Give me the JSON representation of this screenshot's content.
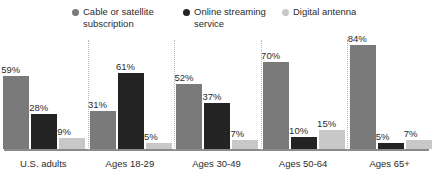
{
  "legend": {
    "items": [
      {
        "label": "Cable or satellite\nsubscription",
        "color": "#7a7a7a",
        "icon": "legend-dot-icon"
      },
      {
        "label": "Online streaming\nservice",
        "color": "#232323",
        "icon": "legend-dot-icon"
      },
      {
        "label": "Digital antenna",
        "color": "#c8c8c8",
        "icon": "legend-dot-icon"
      }
    ]
  },
  "chart_data": {
    "type": "bar",
    "title": "",
    "subtitle": "",
    "xlabel": "",
    "ylabel": "",
    "ylim": [
      0,
      100
    ],
    "grid": false,
    "legend_position": "top",
    "value_suffix": "%",
    "categories": [
      "U.S. adults",
      "Ages 18-29",
      "Ages 30-49",
      "Ages 50-64",
      "Ages 65+"
    ],
    "series": [
      {
        "name": "Cable or satellite subscription",
        "color": "#7a7a7a",
        "values": [
          59,
          31,
          52,
          70,
          84
        ],
        "labels": [
          "59%",
          "31%",
          "52%",
          "70%",
          "84%"
        ]
      },
      {
        "name": "Online streaming service",
        "color": "#232323",
        "values": [
          28,
          61,
          37,
          10,
          5
        ],
        "labels": [
          "28%",
          "61%",
          "37%",
          "10%",
          "5%"
        ]
      },
      {
        "name": "Digital antenna",
        "color": "#c8c8c8",
        "values": [
          9,
          5,
          7,
          15,
          7
        ],
        "labels": [
          "9%",
          "5%",
          "7%",
          "15%",
          "7%"
        ]
      }
    ]
  },
  "axis": {
    "baseline_color": "#8a8a8a",
    "divider_color": "#b9b9b9"
  }
}
